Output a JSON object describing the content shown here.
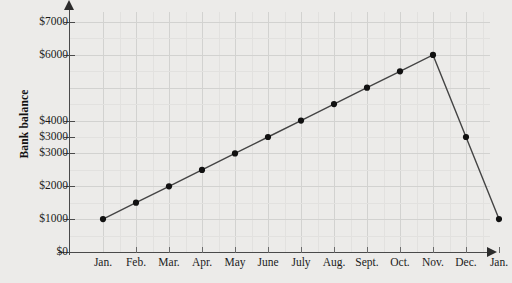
{
  "chart_data": {
    "type": "line",
    "title": "",
    "xlabel": "",
    "ylabel": "Bank balance",
    "categories": [
      "Jan.",
      "Feb.",
      "Mar.",
      "Apr.",
      "May",
      "June",
      "July",
      "Aug.",
      "Sept.",
      "Oct.",
      "Nov.",
      "Dec.",
      "Jan."
    ],
    "values": [
      1000,
      1500,
      2000,
      2500,
      3000,
      3500,
      4000,
      4500,
      5000,
      5500,
      6000,
      3500,
      1000
    ],
    "ytick_labels": [
      "$0",
      "$1000",
      "$2000",
      "$3000",
      "$3000",
      "$4000",
      "$6000",
      "$7000"
    ],
    "ytick_values": [
      0,
      1000,
      2000,
      3000,
      3500,
      4000,
      6000,
      7000
    ],
    "ylim": [
      0,
      7000
    ],
    "grid": true,
    "minor_grid": true,
    "legend": "none",
    "marker": "filled-circle",
    "line_color": "#444444",
    "marker_color": "#111111",
    "grid_color": "#d2d2d0",
    "background_color": "#ecebe9"
  },
  "axis": {
    "y_title": "Bank balance"
  }
}
